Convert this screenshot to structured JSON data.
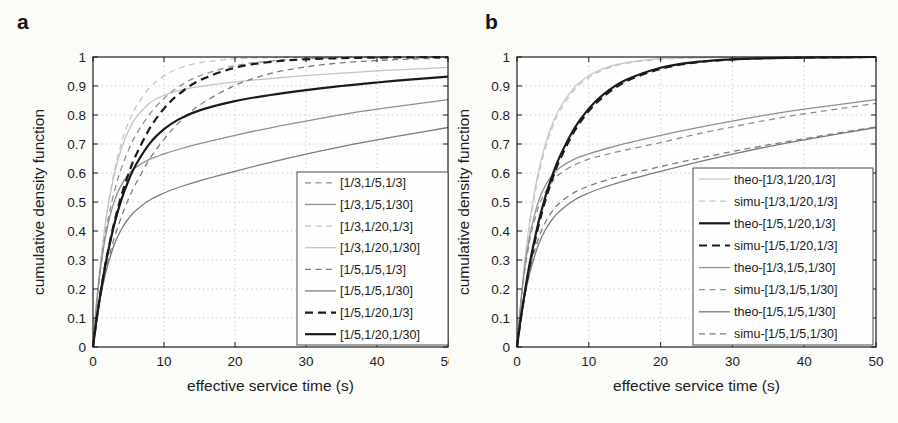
{
  "page": {
    "background": "#fbfbf8"
  },
  "chart_data": [
    {
      "type": "line",
      "panel_label": "a",
      "xlabel": "effective service time (s)",
      "ylabel": "cumulative density function",
      "xlim": [
        0,
        50
      ],
      "ylim": [
        0,
        1
      ],
      "xticks": [
        0,
        10,
        20,
        30,
        40,
        50
      ],
      "xtick_labels": [
        "0",
        "10",
        "20",
        "30",
        "40",
        "50"
      ],
      "yticks": [
        0,
        0.1,
        0.2,
        0.3,
        0.4,
        0.5,
        0.6,
        0.7,
        0.8,
        0.9,
        1
      ],
      "ytick_labels": [
        "0",
        "0.1",
        "0.2",
        "0.3",
        "0.4",
        "0.5",
        "0.6",
        "0.7",
        "0.8",
        "0.9",
        "1"
      ],
      "grid": true,
      "legend_position": "lower right",
      "x": [
        0,
        0.5,
        1,
        1.5,
        2,
        3,
        4,
        5,
        6,
        8,
        10,
        12,
        15,
        20,
        25,
        30,
        35,
        40,
        45,
        50
      ],
      "series": [
        {
          "name": "[1/3,1/5,1/3]",
          "style": "dashed",
          "color": "#8f8f8f",
          "width": 1.3,
          "values": [
            0,
            0.147,
            0.261,
            0.352,
            0.425,
            0.536,
            0.617,
            0.679,
            0.729,
            0.804,
            0.857,
            0.896,
            0.935,
            0.97,
            0.986,
            0.994,
            0.997,
            0.999,
            0.999,
            1.0
          ]
        },
        {
          "name": "[1/3,1/5,1/30]",
          "style": "solid",
          "color": "#8f8f8f",
          "width": 1.3,
          "values": [
            0,
            0.146,
            0.258,
            0.344,
            0.411,
            0.503,
            0.559,
            0.595,
            0.619,
            0.648,
            0.666,
            0.681,
            0.701,
            0.73,
            0.756,
            0.779,
            0.801,
            0.82,
            0.837,
            0.853
          ]
        },
        {
          "name": "[1/3,1/20,1/3]",
          "style": "dashed",
          "color": "#c4c4c4",
          "width": 1.3,
          "values": [
            0,
            0.152,
            0.278,
            0.382,
            0.47,
            0.606,
            0.703,
            0.774,
            0.826,
            0.895,
            0.935,
            0.96,
            0.98,
            0.994,
            0.998,
            0.999,
            1.0,
            1.0,
            1.0,
            1.0
          ]
        },
        {
          "name": "[1/3,1/20,1/30]",
          "style": "solid",
          "color": "#c4c4c4",
          "width": 1.3,
          "values": [
            0,
            0.152,
            0.277,
            0.38,
            0.466,
            0.596,
            0.685,
            0.746,
            0.789,
            0.841,
            0.868,
            0.884,
            0.898,
            0.914,
            0.926,
            0.936,
            0.944,
            0.952,
            0.958,
            0.964
          ]
        },
        {
          "name": "[1/5,1/5,1/3]",
          "style": "dashed",
          "color": "#7b7b7b",
          "width": 1.3,
          "values": [
            0,
            0.091,
            0.167,
            0.231,
            0.286,
            0.376,
            0.449,
            0.51,
            0.562,
            0.649,
            0.716,
            0.771,
            0.834,
            0.902,
            0.943,
            0.966,
            0.98,
            0.988,
            0.993,
            0.996
          ]
        },
        {
          "name": "[1/5,1/5,1/30]",
          "style": "solid",
          "color": "#7b7b7b",
          "width": 1.3,
          "values": [
            0,
            0.091,
            0.165,
            0.226,
            0.276,
            0.353,
            0.406,
            0.443,
            0.47,
            0.507,
            0.531,
            0.55,
            0.573,
            0.606,
            0.637,
            0.665,
            0.691,
            0.714,
            0.736,
            0.757
          ]
        },
        {
          "name": "[1/5,1/20,1/3]",
          "style": "dashed",
          "color": "#1a1a1a",
          "width": 2.2,
          "values": [
            0,
            0.094,
            0.177,
            0.252,
            0.318,
            0.43,
            0.522,
            0.597,
            0.659,
            0.754,
            0.822,
            0.87,
            0.919,
            0.963,
            0.983,
            0.992,
            0.996,
            0.998,
            0.999,
            1.0
          ]
        },
        {
          "name": "[1/5,1/20,1/30]",
          "style": "solid",
          "color": "#1a1a1a",
          "width": 2.2,
          "values": [
            0,
            0.094,
            0.177,
            0.25,
            0.315,
            0.423,
            0.508,
            0.574,
            0.627,
            0.702,
            0.751,
            0.784,
            0.816,
            0.848,
            0.869,
            0.886,
            0.9,
            0.912,
            0.923,
            0.932
          ]
        }
      ]
    },
    {
      "type": "line",
      "panel_label": "b",
      "xlabel": "effective service time (s)",
      "ylabel": "cumulative density function",
      "xlim": [
        0,
        50
      ],
      "ylim": [
        0,
        1
      ],
      "xticks": [
        0,
        10,
        20,
        30,
        40,
        50
      ],
      "xtick_labels": [
        "0",
        "10",
        "20",
        "30",
        "40",
        "50"
      ],
      "yticks": [
        0,
        0.1,
        0.2,
        0.3,
        0.4,
        0.5,
        0.6,
        0.7,
        0.8,
        0.9,
        1
      ],
      "ytick_labels": [
        "0",
        "0.1",
        "0.2",
        "0.3",
        "0.4",
        "0.5",
        "0.6",
        "0.7",
        "0.8",
        "0.9",
        "1"
      ],
      "grid": true,
      "legend_position": "lower right",
      "x": [
        0,
        0.5,
        1,
        1.5,
        2,
        3,
        4,
        5,
        6,
        8,
        10,
        12,
        15,
        20,
        25,
        30,
        35,
        40,
        45,
        50
      ],
      "series": [
        {
          "name": "theo-[1/3,1/20,1/3]",
          "style": "solid",
          "color": "#c4c4c4",
          "width": 1.2,
          "values": [
            0,
            0.152,
            0.278,
            0.382,
            0.47,
            0.606,
            0.703,
            0.774,
            0.826,
            0.895,
            0.935,
            0.96,
            0.98,
            0.994,
            0.998,
            0.999,
            1.0,
            1.0,
            1.0,
            1.0
          ]
        },
        {
          "name": "simu-[1/3,1/20,1/3]",
          "style": "dashed",
          "color": "#c4c4c4",
          "width": 1.3,
          "values": [
            0,
            0.148,
            0.27,
            0.372,
            0.458,
            0.591,
            0.689,
            0.762,
            0.816,
            0.887,
            0.929,
            0.955,
            0.977,
            0.992,
            0.997,
            0.999,
            1.0,
            1.0,
            1.0,
            1.0
          ]
        },
        {
          "name": "theo-[1/5,1/20,1/3]",
          "style": "solid",
          "color": "#1a1a1a",
          "width": 2.2,
          "values": [
            0,
            0.094,
            0.177,
            0.252,
            0.318,
            0.43,
            0.522,
            0.597,
            0.659,
            0.754,
            0.822,
            0.87,
            0.919,
            0.963,
            0.983,
            0.992,
            0.996,
            0.998,
            0.999,
            1.0
          ]
        },
        {
          "name": "simu-[1/5,1/20,1/3]",
          "style": "dashed",
          "color": "#1a1a1a",
          "width": 2.0,
          "values": [
            0,
            0.091,
            0.171,
            0.243,
            0.307,
            0.417,
            0.508,
            0.584,
            0.647,
            0.744,
            0.813,
            0.862,
            0.913,
            0.959,
            0.981,
            0.991,
            0.996,
            0.998,
            0.999,
            1.0
          ]
        },
        {
          "name": "theo-[1/3,1/5,1/30]",
          "style": "solid",
          "color": "#8f8f8f",
          "width": 1.3,
          "values": [
            0,
            0.146,
            0.258,
            0.344,
            0.411,
            0.503,
            0.559,
            0.595,
            0.619,
            0.648,
            0.666,
            0.681,
            0.701,
            0.73,
            0.756,
            0.779,
            0.801,
            0.82,
            0.837,
            0.853
          ]
        },
        {
          "name": "simu-[1/3,1/5,1/30]",
          "style": "dashed",
          "color": "#8f8f8f",
          "width": 1.3,
          "values": [
            0,
            0.141,
            0.248,
            0.33,
            0.395,
            0.483,
            0.537,
            0.573,
            0.598,
            0.628,
            0.648,
            0.661,
            0.679,
            0.705,
            0.734,
            0.759,
            0.783,
            0.804,
            0.822,
            0.84
          ]
        },
        {
          "name": "theo-[1/5,1/5,1/30]",
          "style": "solid",
          "color": "#7b7b7b",
          "width": 1.3,
          "values": [
            0,
            0.091,
            0.165,
            0.226,
            0.276,
            0.353,
            0.406,
            0.443,
            0.47,
            0.507,
            0.531,
            0.55,
            0.573,
            0.606,
            0.637,
            0.665,
            0.691,
            0.714,
            0.736,
            0.757
          ]
        },
        {
          "name": "simu-[1/5,1/5,1/30]",
          "style": "dashed",
          "color": "#7b7b7b",
          "width": 1.3,
          "values": [
            0,
            0.095,
            0.173,
            0.238,
            0.292,
            0.375,
            0.432,
            0.471,
            0.498,
            0.533,
            0.555,
            0.572,
            0.593,
            0.622,
            0.649,
            0.674,
            0.697,
            0.718,
            0.739,
            0.759
          ]
        }
      ]
    }
  ]
}
